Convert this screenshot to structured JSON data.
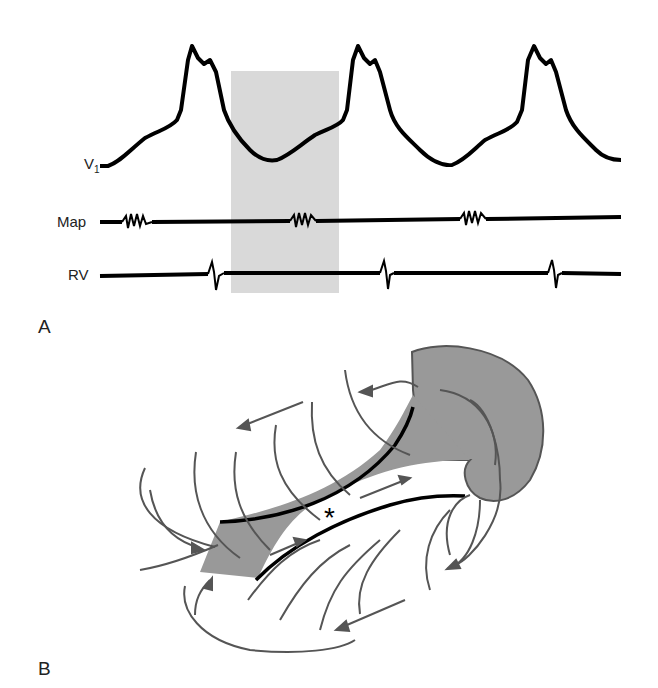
{
  "panel_a": {
    "label": "A",
    "traces": [
      {
        "name": "V1",
        "label_main": "V",
        "label_sub": "1"
      },
      {
        "name": "Map",
        "label_main": "Map"
      },
      {
        "name": "RV",
        "label_main": "RV"
      }
    ],
    "highlight_color": "#d9d9d9"
  },
  "panel_b": {
    "label": "B",
    "center_marker": "*",
    "fill_color": "#999999",
    "line_color": "#555555"
  }
}
